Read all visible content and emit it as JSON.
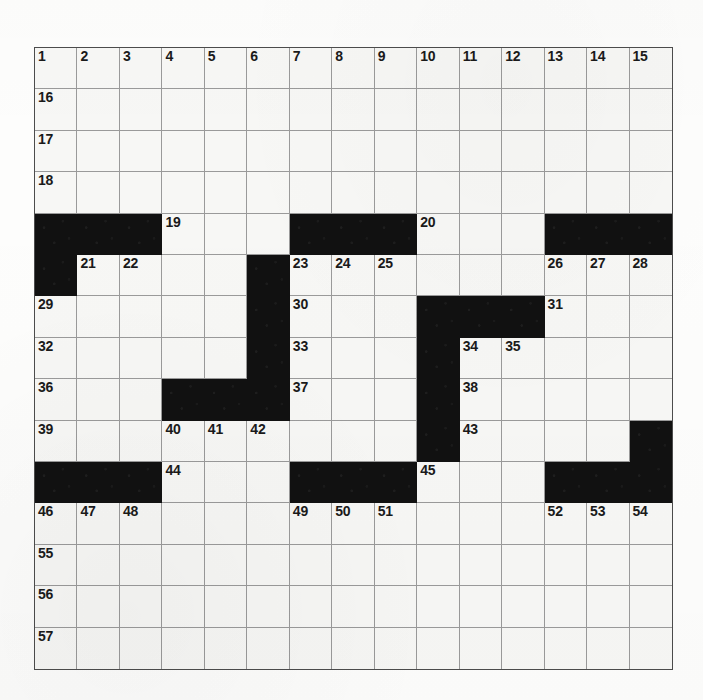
{
  "puzzle": {
    "type": "crossword-grid",
    "title": "Crossword puzzle grid",
    "columns": 15,
    "rows": 15,
    "colors": {
      "block": "#111111",
      "cell": "#f7f7f5",
      "grid_line": "#9a9a9a",
      "border": "#4c4c4c",
      "number_text": "#1a1a1a",
      "page_background": "#fdfdfc"
    },
    "blocks": [
      [
        5,
        1
      ],
      [
        5,
        2
      ],
      [
        5,
        3
      ],
      [
        5,
        7
      ],
      [
        5,
        8
      ],
      [
        5,
        9
      ],
      [
        5,
        13
      ],
      [
        5,
        14
      ],
      [
        5,
        15
      ],
      [
        6,
        1
      ],
      [
        6,
        6
      ],
      [
        7,
        6
      ],
      [
        7,
        10
      ],
      [
        7,
        11
      ],
      [
        7,
        12
      ],
      [
        8,
        6
      ],
      [
        8,
        10
      ],
      [
        9,
        4
      ],
      [
        9,
        5
      ],
      [
        9,
        6
      ],
      [
        9,
        10
      ],
      [
        10,
        10
      ],
      [
        10,
        15
      ],
      [
        11,
        1
      ],
      [
        11,
        2
      ],
      [
        11,
        3
      ],
      [
        11,
        7
      ],
      [
        11,
        8
      ],
      [
        11,
        9
      ],
      [
        11,
        13
      ],
      [
        11,
        14
      ],
      [
        11,
        15
      ]
    ],
    "numbers": [
      {
        "n": "1",
        "row": 1,
        "col": 1
      },
      {
        "n": "2",
        "row": 1,
        "col": 2
      },
      {
        "n": "3",
        "row": 1,
        "col": 3
      },
      {
        "n": "4",
        "row": 1,
        "col": 4
      },
      {
        "n": "5",
        "row": 1,
        "col": 5
      },
      {
        "n": "6",
        "row": 1,
        "col": 6
      },
      {
        "n": "7",
        "row": 1,
        "col": 7
      },
      {
        "n": "8",
        "row": 1,
        "col": 8
      },
      {
        "n": "9",
        "row": 1,
        "col": 9
      },
      {
        "n": "10",
        "row": 1,
        "col": 10
      },
      {
        "n": "11",
        "row": 1,
        "col": 11
      },
      {
        "n": "12",
        "row": 1,
        "col": 12
      },
      {
        "n": "13",
        "row": 1,
        "col": 13
      },
      {
        "n": "14",
        "row": 1,
        "col": 14
      },
      {
        "n": "15",
        "row": 1,
        "col": 15
      },
      {
        "n": "16",
        "row": 2,
        "col": 1
      },
      {
        "n": "17",
        "row": 3,
        "col": 1
      },
      {
        "n": "18",
        "row": 4,
        "col": 1
      },
      {
        "n": "19",
        "row": 5,
        "col": 4
      },
      {
        "n": "20",
        "row": 5,
        "col": 10
      },
      {
        "n": "21",
        "row": 6,
        "col": 2
      },
      {
        "n": "22",
        "row": 6,
        "col": 3
      },
      {
        "n": "23",
        "row": 6,
        "col": 7
      },
      {
        "n": "24",
        "row": 6,
        "col": 8
      },
      {
        "n": "25",
        "row": 6,
        "col": 9
      },
      {
        "n": "26",
        "row": 6,
        "col": 13
      },
      {
        "n": "27",
        "row": 6,
        "col": 14
      },
      {
        "n": "28",
        "row": 6,
        "col": 15
      },
      {
        "n": "29",
        "row": 7,
        "col": 1
      },
      {
        "n": "30",
        "row": 7,
        "col": 7
      },
      {
        "n": "31",
        "row": 7,
        "col": 13
      },
      {
        "n": "32",
        "row": 8,
        "col": 1
      },
      {
        "n": "33",
        "row": 8,
        "col": 7
      },
      {
        "n": "34",
        "row": 8,
        "col": 11
      },
      {
        "n": "35",
        "row": 8,
        "col": 12
      },
      {
        "n": "36",
        "row": 9,
        "col": 1
      },
      {
        "n": "37",
        "row": 9,
        "col": 7
      },
      {
        "n": "38",
        "row": 9,
        "col": 11
      },
      {
        "n": "39",
        "row": 10,
        "col": 1
      },
      {
        "n": "40",
        "row": 10,
        "col": 4
      },
      {
        "n": "41",
        "row": 10,
        "col": 5
      },
      {
        "n": "42",
        "row": 10,
        "col": 6
      },
      {
        "n": "43",
        "row": 10,
        "col": 11
      },
      {
        "n": "44",
        "row": 11,
        "col": 4
      },
      {
        "n": "45",
        "row": 11,
        "col": 10
      },
      {
        "n": "46",
        "row": 12,
        "col": 1
      },
      {
        "n": "47",
        "row": 12,
        "col": 2
      },
      {
        "n": "48",
        "row": 12,
        "col": 3
      },
      {
        "n": "49",
        "row": 12,
        "col": 7
      },
      {
        "n": "50",
        "row": 12,
        "col": 8
      },
      {
        "n": "51",
        "row": 12,
        "col": 9
      },
      {
        "n": "52",
        "row": 12,
        "col": 13
      },
      {
        "n": "53",
        "row": 12,
        "col": 14
      },
      {
        "n": "54",
        "row": 12,
        "col": 15
      },
      {
        "n": "55",
        "row": 13,
        "col": 1
      },
      {
        "n": "56",
        "row": 14,
        "col": 1
      },
      {
        "n": "57",
        "row": 15,
        "col": 1
      }
    ]
  }
}
